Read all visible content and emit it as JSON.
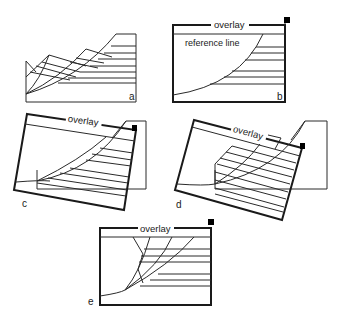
{
  "figure": {
    "panels": [
      {
        "id": "a",
        "label": "a"
      },
      {
        "id": "b",
        "label": "b",
        "overlay_label": "overlay",
        "reference_label": "reference line"
      },
      {
        "id": "c",
        "label": "c",
        "overlay_label": "overlay"
      },
      {
        "id": "d",
        "label": "d",
        "overlay_label": "overlay"
      },
      {
        "id": "e",
        "label": "e",
        "overlay_label": "overlay"
      }
    ]
  },
  "colors": {
    "line": "#2a2a2a",
    "frame": "#1a1a1a",
    "marker": "#000000",
    "background": "#ffffff"
  }
}
